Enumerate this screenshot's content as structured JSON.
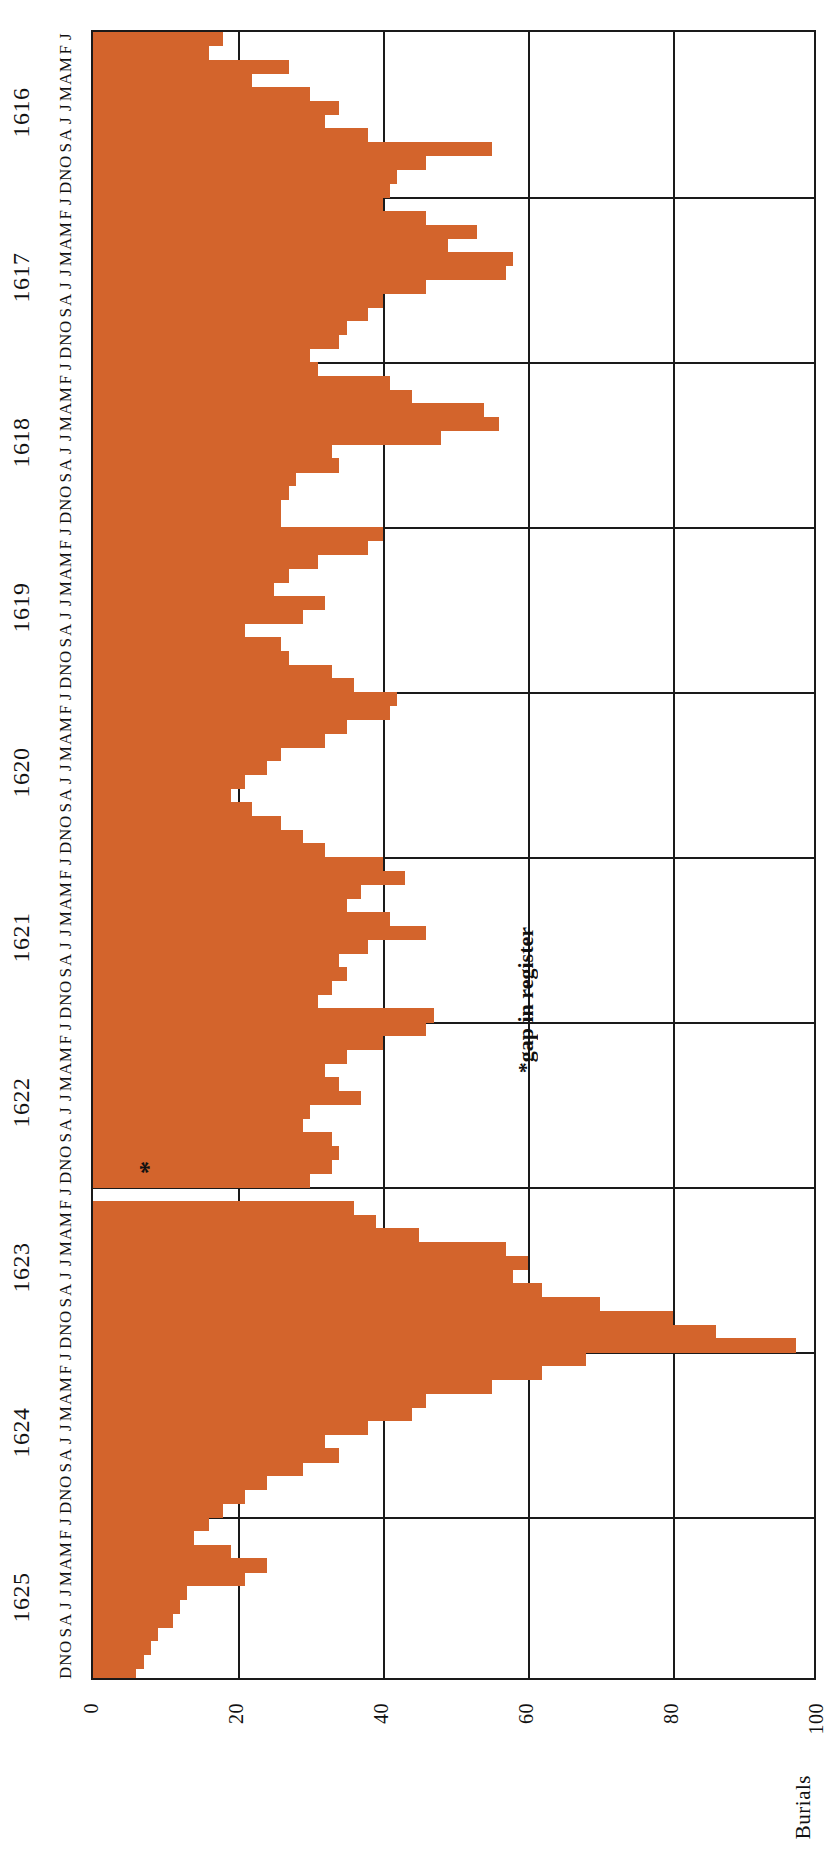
{
  "figure": {
    "ylabel": "Burials",
    "annotation": "*gap in register",
    "gap_marker": "*",
    "orange": "#d3642c",
    "axis_color": "#1a1a1a"
  },
  "axis": {
    "y_ticks": [
      "100",
      "80",
      "60",
      "40",
      "20",
      "0"
    ],
    "y_tick_values": [
      100,
      80,
      60,
      40,
      20,
      0
    ],
    "month_letters": [
      "J",
      "F",
      "M",
      "A",
      "M",
      "J",
      "J",
      "A",
      "S",
      "O",
      "N",
      "D"
    ],
    "years": [
      "1616",
      "1617",
      "1618",
      "1619",
      "1620",
      "1621",
      "1622",
      "1623",
      "1624",
      "1625"
    ]
  },
  "chart_data": {
    "type": "bar",
    "title": "",
    "subtitle": "",
    "xlabel": "",
    "ylabel": "Burials",
    "ylim": [
      0,
      100
    ],
    "xlim_years": [
      1616,
      1625
    ],
    "grid": true,
    "legend": null,
    "orientation": "vertical-bars-rotated-90ccw",
    "annotations": [
      {
        "text": "*gap in register",
        "year": 1623,
        "note": "asterisk marks missing months in the burial register"
      }
    ],
    "categories": [
      "1616-J",
      "1616-F",
      "1616-M",
      "1616-A",
      "1616-M",
      "1616-J",
      "1616-J",
      "1616-A",
      "1616-S",
      "1616-O",
      "1616-N",
      "1616-D",
      "1617-J",
      "1617-F",
      "1617-M",
      "1617-A",
      "1617-M",
      "1617-J",
      "1617-J",
      "1617-A",
      "1617-S",
      "1617-O",
      "1617-N",
      "1617-D",
      "1618-J",
      "1618-F",
      "1618-M",
      "1618-A",
      "1618-M",
      "1618-J",
      "1618-J",
      "1618-A",
      "1618-S",
      "1618-O",
      "1618-N",
      "1618-D",
      "1619-J",
      "1619-F",
      "1619-M",
      "1619-A",
      "1619-M",
      "1619-J",
      "1619-J",
      "1619-A",
      "1619-S",
      "1619-O",
      "1619-N",
      "1619-D",
      "1620-J",
      "1620-F",
      "1620-M",
      "1620-A",
      "1620-M",
      "1620-J",
      "1620-J",
      "1620-A",
      "1620-S",
      "1620-O",
      "1620-N",
      "1620-D",
      "1621-J",
      "1621-F",
      "1621-M",
      "1621-A",
      "1621-M",
      "1621-J",
      "1621-J",
      "1621-A",
      "1621-S",
      "1621-O",
      "1621-N",
      "1621-D",
      "1622-J",
      "1622-F",
      "1622-M",
      "1622-A",
      "1622-M",
      "1622-J",
      "1622-J",
      "1622-A",
      "1622-S",
      "1622-O",
      "1622-N",
      "1622-D",
      "1623-J",
      "1623-F",
      "1623-M",
      "1623-A",
      "1623-M",
      "1623-J",
      "1623-J",
      "1623-A",
      "1623-S",
      "1623-O",
      "1623-N",
      "1623-D",
      "1624-J",
      "1624-F",
      "1624-M",
      "1624-A",
      "1624-M",
      "1624-J",
      "1624-J",
      "1624-A",
      "1624-S",
      "1624-O",
      "1624-N",
      "1624-D",
      "1625-J",
      "1625-F",
      "1625-M",
      "1625-A",
      "1625-M",
      "1625-J",
      "1625-J",
      "1625-A",
      "1625-S",
      "1625-O",
      "1625-N",
      "1625-D"
    ],
    "values": [
      18,
      16,
      27,
      22,
      30,
      34,
      32,
      38,
      55,
      46,
      42,
      41,
      40,
      46,
      53,
      49,
      58,
      57,
      46,
      40,
      38,
      35,
      34,
      30,
      31,
      41,
      44,
      54,
      56,
      48,
      33,
      34,
      28,
      27,
      26,
      26,
      40,
      38,
      31,
      27,
      25,
      32,
      29,
      21,
      26,
      27,
      33,
      36,
      42,
      41,
      35,
      32,
      26,
      24,
      21,
      19,
      22,
      26,
      29,
      32,
      40,
      43,
      37,
      35,
      41,
      46,
      38,
      34,
      35,
      33,
      31,
      47,
      46,
      40,
      35,
      32,
      34,
      37,
      30,
      29,
      33,
      34,
      33,
      30,
      0,
      36,
      39,
      45,
      57,
      60,
      58,
      62,
      70,
      80,
      86,
      97,
      68,
      62,
      55,
      46,
      44,
      38,
      32,
      34,
      29,
      24,
      21,
      18,
      16,
      14,
      19,
      24,
      21,
      13,
      12,
      11,
      9,
      8,
      7,
      6
    ],
    "gap_index": 84,
    "max_value": 97,
    "peak_period": "1623-D"
  }
}
